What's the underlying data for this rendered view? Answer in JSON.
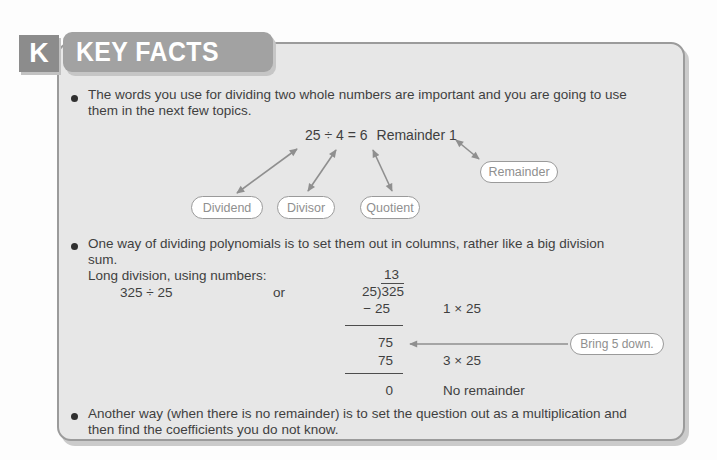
{
  "header": {
    "tab_letter": "K",
    "title": "KEY FACTS"
  },
  "colors": {
    "panel_fill": "#e7e7e7",
    "panel_border": "#9b9b9b",
    "banner_gray": "#a2a2a2",
    "tab_gray": "#8c8c8c",
    "text_gray": "#3f3f3f",
    "label_gray": "#8f8f8f"
  },
  "bullets": [
    {
      "lines": [
        "The words you use for dividing two whole numbers are important and you are going to use",
        "them in the next few topics."
      ]
    },
    {
      "lines": [
        "One way of dividing polynomials is to set them out in columns, rather like a big division",
        "sum."
      ]
    },
    {
      "lines": [
        "Another way (when there is no remainder) is to set the question out as a multiplication and",
        "then find the coefficients you do not know."
      ]
    }
  ],
  "terminology": {
    "equation_left": "25 ÷ 4 = 6",
    "equation_right": "Remainder 1",
    "labels": [
      "Dividend",
      "Divisor",
      "Quotient",
      "Remainder"
    ]
  },
  "division": {
    "intro": "Long division, using numbers:",
    "expression": "325 ÷ 25",
    "or_label": "or",
    "quotient": "13",
    "divisor": "25",
    "bracket": ")",
    "dividend": "325",
    "row_subtract": "− 25",
    "note1": "1 × 25",
    "row_bring_down": "75",
    "row_product": "75",
    "note2": "3 × 25",
    "row_zero": "0",
    "note3": "No remainder",
    "callout": "Bring 5 down."
  }
}
